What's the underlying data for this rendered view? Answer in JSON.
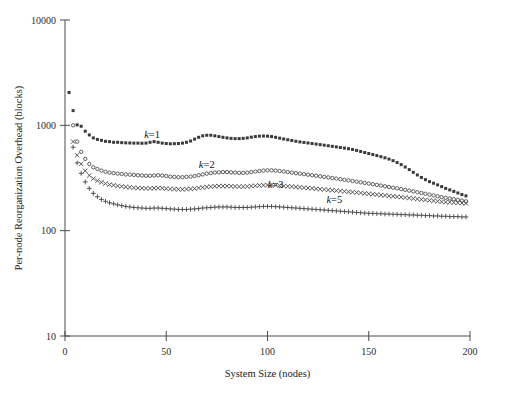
{
  "chart_data": {
    "type": "scatter",
    "title": "",
    "xlabel": "System Size (nodes)",
    "ylabel": "Per-node Reorganization Overhead (blocks)",
    "xlim": [
      0,
      200
    ],
    "ylim": [
      10,
      10000
    ],
    "yscale": "log",
    "xscale": "linear",
    "grid": false,
    "legend_position": "inline-annotations",
    "xticks": [
      0,
      50,
      100,
      150,
      200
    ],
    "xtick_labels": [
      "0",
      "50",
      "100",
      "150",
      "200"
    ],
    "yticks": [
      10,
      100,
      1000,
      10000
    ],
    "ytick_labels": [
      "10",
      "100",
      "1000",
      "10000"
    ],
    "annotations": [
      {
        "text": "k=1",
        "x": 43,
        "y": 760
      },
      {
        "text": "k=2",
        "x": 70,
        "y": 390
      },
      {
        "text": "k=3",
        "x": 104,
        "y": 255
      },
      {
        "text": "k=5",
        "x": 133,
        "y": 185
      }
    ],
    "series": [
      {
        "name": "k=1",
        "marker": "square",
        "x": [
          2,
          4,
          6,
          8,
          10,
          12,
          14,
          16,
          18,
          20,
          22,
          24,
          26,
          28,
          30,
          32,
          34,
          36,
          38,
          40,
          42,
          44,
          46,
          48,
          50,
          52,
          54,
          56,
          58,
          60,
          62,
          64,
          66,
          68,
          70,
          72,
          74,
          76,
          78,
          80,
          82,
          84,
          86,
          88,
          90,
          92,
          94,
          96,
          98,
          100,
          102,
          104,
          106,
          108,
          110,
          112,
          114,
          116,
          118,
          120,
          122,
          124,
          126,
          128,
          130,
          132,
          134,
          136,
          138,
          140,
          142,
          144,
          146,
          148,
          150,
          152,
          154,
          156,
          158,
          160,
          162,
          164,
          166,
          168,
          170,
          172,
          174,
          176,
          178,
          180,
          182,
          184,
          186,
          188,
          190,
          192,
          194,
          196,
          198
        ],
        "y": [
          2050,
          1380,
          1010,
          980,
          880,
          810,
          760,
          735,
          720,
          705,
          700,
          690,
          690,
          685,
          682,
          680,
          678,
          678,
          676,
          678,
          690,
          700,
          690,
          678,
          672,
          668,
          670,
          672,
          678,
          690,
          710,
          740,
          770,
          795,
          805,
          805,
          795,
          782,
          770,
          760,
          752,
          748,
          748,
          752,
          760,
          772,
          782,
          790,
          792,
          790,
          782,
          770,
          756,
          742,
          730,
          718,
          706,
          696,
          688,
          680,
          672,
          664,
          656,
          648,
          640,
          632,
          624,
          616,
          608,
          600,
          590,
          578,
          565,
          552,
          540,
          528,
          516,
          504,
          492,
          478,
          462,
          444,
          424,
          402,
          380,
          358,
          338,
          320,
          305,
          292,
          282,
          272,
          262,
          252,
          244,
          236,
          228,
          220,
          214
        ]
      },
      {
        "name": "k=2",
        "marker": "circle",
        "x": [
          4,
          6,
          8,
          10,
          12,
          14,
          16,
          18,
          20,
          22,
          24,
          26,
          28,
          30,
          32,
          34,
          36,
          38,
          40,
          42,
          44,
          46,
          48,
          50,
          52,
          54,
          56,
          58,
          60,
          62,
          64,
          66,
          68,
          70,
          72,
          74,
          76,
          78,
          80,
          82,
          84,
          86,
          88,
          90,
          92,
          94,
          96,
          98,
          100,
          102,
          104,
          106,
          108,
          110,
          112,
          114,
          116,
          118,
          120,
          122,
          124,
          126,
          128,
          130,
          132,
          134,
          136,
          138,
          140,
          142,
          144,
          146,
          148,
          150,
          152,
          154,
          156,
          158,
          160,
          162,
          164,
          166,
          168,
          170,
          172,
          174,
          176,
          178,
          180,
          182,
          184,
          186,
          188,
          190,
          192,
          194,
          196,
          198
        ],
        "y": [
          1000,
          700,
          560,
          480,
          430,
          400,
          385,
          372,
          362,
          356,
          352,
          348,
          345,
          342,
          340,
          338,
          336,
          334,
          332,
          332,
          334,
          336,
          334,
          330,
          326,
          324,
          322,
          322,
          324,
          326,
          330,
          336,
          342,
          348,
          352,
          356,
          358,
          360,
          360,
          358,
          356,
          354,
          354,
          356,
          360,
          364,
          368,
          372,
          374,
          374,
          372,
          368,
          364,
          360,
          356,
          352,
          348,
          344,
          340,
          336,
          332,
          328,
          324,
          320,
          316,
          312,
          308,
          304,
          300,
          296,
          292,
          288,
          284,
          280,
          276,
          272,
          268,
          264,
          260,
          256,
          252,
          248,
          244,
          240,
          236,
          232,
          228,
          224,
          220,
          216,
          212,
          208,
          205,
          202,
          199,
          196,
          193,
          190
        ]
      },
      {
        "name": "k=3",
        "marker": "x",
        "x": [
          4,
          6,
          8,
          10,
          12,
          14,
          16,
          18,
          20,
          22,
          24,
          26,
          28,
          30,
          32,
          34,
          36,
          38,
          40,
          42,
          44,
          46,
          48,
          50,
          52,
          54,
          56,
          58,
          60,
          62,
          64,
          66,
          68,
          70,
          72,
          74,
          76,
          78,
          80,
          82,
          84,
          86,
          88,
          90,
          92,
          94,
          96,
          98,
          100,
          102,
          104,
          106,
          108,
          110,
          112,
          114,
          116,
          118,
          120,
          122,
          124,
          126,
          128,
          130,
          132,
          134,
          136,
          138,
          140,
          142,
          144,
          146,
          148,
          150,
          152,
          154,
          156,
          158,
          160,
          162,
          164,
          166,
          168,
          170,
          172,
          174,
          176,
          178,
          180,
          182,
          184,
          186,
          188,
          190,
          192,
          194,
          196,
          198
        ],
        "y": [
          700,
          520,
          430,
          370,
          335,
          312,
          298,
          288,
          280,
          274,
          270,
          266,
          263,
          260,
          258,
          256,
          254,
          253,
          252,
          252,
          253,
          254,
          253,
          251,
          249,
          248,
          247,
          247,
          248,
          249,
          251,
          254,
          257,
          260,
          262,
          264,
          265,
          265,
          265,
          264,
          263,
          262,
          262,
          263,
          265,
          267,
          269,
          270,
          271,
          271,
          270,
          268,
          266,
          264,
          262,
          260,
          258,
          256,
          254,
          252,
          250,
          248,
          246,
          244,
          242,
          240,
          238,
          236,
          234,
          232,
          230,
          228,
          226,
          224,
          222,
          220,
          218,
          216,
          214,
          212,
          210,
          208,
          206,
          204,
          202,
          200,
          198,
          196,
          194,
          192,
          190,
          188,
          187,
          186,
          185,
          184,
          183,
          182
        ]
      },
      {
        "name": "k=5",
        "marker": "plus",
        "x": [
          4,
          6,
          8,
          10,
          12,
          14,
          16,
          18,
          20,
          22,
          24,
          26,
          28,
          30,
          32,
          34,
          36,
          38,
          40,
          42,
          44,
          46,
          48,
          50,
          52,
          54,
          56,
          58,
          60,
          62,
          64,
          66,
          68,
          70,
          72,
          74,
          76,
          78,
          80,
          82,
          84,
          86,
          88,
          90,
          92,
          94,
          96,
          98,
          100,
          102,
          104,
          106,
          108,
          110,
          112,
          114,
          116,
          118,
          120,
          122,
          124,
          126,
          128,
          130,
          132,
          134,
          136,
          138,
          140,
          142,
          144,
          146,
          148,
          150,
          152,
          154,
          156,
          158,
          160,
          162,
          164,
          166,
          168,
          170,
          172,
          174,
          176,
          178,
          180,
          182,
          184,
          186,
          188,
          190,
          192,
          194,
          196,
          198
        ],
        "y": [
          620,
          440,
          350,
          290,
          252,
          226,
          210,
          198,
          190,
          184,
          180,
          176,
          173,
          170,
          168,
          166,
          165,
          164,
          163,
          163,
          164,
          164,
          163,
          162,
          161,
          160,
          159,
          159,
          159,
          160,
          161,
          162,
          164,
          165,
          166,
          167,
          168,
          168,
          168,
          167,
          166,
          166,
          166,
          166,
          167,
          168,
          169,
          170,
          170,
          170,
          169,
          168,
          167,
          166,
          165,
          164,
          163,
          162,
          161,
          160,
          159,
          158,
          157,
          156,
          155,
          154,
          153,
          152,
          151,
          150,
          149,
          148,
          147,
          146,
          146,
          145,
          145,
          144,
          144,
          143,
          143,
          142,
          142,
          141,
          141,
          140,
          140,
          139,
          139,
          138,
          138,
          137,
          137,
          136,
          136,
          136,
          135,
          135
        ]
      }
    ]
  }
}
